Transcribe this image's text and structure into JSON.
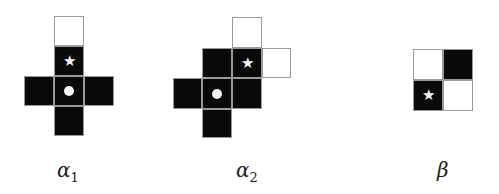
{
  "figures": [
    {
      "id": "alpha1",
      "label": "α",
      "subscript": "1",
      "label_pos": [
        57,
        160
      ],
      "cells": [
        {
          "x": 54,
          "y": 16,
          "w": 30,
          "h": 30,
          "fill": "white",
          "mark": ""
        },
        {
          "x": 54,
          "y": 46,
          "w": 30,
          "h": 30,
          "fill": "black",
          "mark": "star"
        },
        {
          "x": 24,
          "y": 76,
          "w": 30,
          "h": 30,
          "fill": "black",
          "mark": ""
        },
        {
          "x": 54,
          "y": 76,
          "w": 30,
          "h": 30,
          "fill": "black",
          "mark": "dot"
        },
        {
          "x": 84,
          "y": 76,
          "w": 30,
          "h": 30,
          "fill": "black",
          "mark": ""
        },
        {
          "x": 54,
          "y": 106,
          "w": 30,
          "h": 30,
          "fill": "black",
          "mark": ""
        }
      ]
    },
    {
      "id": "alpha2",
      "label": "α",
      "subscript": "2",
      "label_pos": [
        236,
        160
      ],
      "cells": [
        {
          "x": 232,
          "y": 17,
          "w": 30,
          "h": 31,
          "fill": "white",
          "mark": ""
        },
        {
          "x": 202,
          "y": 48,
          "w": 30,
          "h": 30,
          "fill": "black",
          "mark": ""
        },
        {
          "x": 232,
          "y": 48,
          "w": 30,
          "h": 30,
          "fill": "black",
          "mark": "star"
        },
        {
          "x": 262,
          "y": 48,
          "w": 29,
          "h": 30,
          "fill": "white",
          "mark": ""
        },
        {
          "x": 173,
          "y": 78,
          "w": 29,
          "h": 31,
          "fill": "black",
          "mark": ""
        },
        {
          "x": 202,
          "y": 78,
          "w": 30,
          "h": 31,
          "fill": "black",
          "mark": "dot"
        },
        {
          "x": 232,
          "y": 78,
          "w": 30,
          "h": 31,
          "fill": "black",
          "mark": ""
        },
        {
          "x": 202,
          "y": 109,
          "w": 30,
          "h": 29,
          "fill": "black",
          "mark": ""
        }
      ]
    },
    {
      "id": "beta",
      "label": "β",
      "subscript": "",
      "label_pos": [
        437,
        160
      ],
      "cells": [
        {
          "x": 413,
          "y": 49,
          "w": 30,
          "h": 31,
          "fill": "white",
          "mark": ""
        },
        {
          "x": 443,
          "y": 49,
          "w": 30,
          "h": 31,
          "fill": "black",
          "mark": ""
        },
        {
          "x": 413,
          "y": 80,
          "w": 30,
          "h": 31,
          "fill": "black",
          "mark": "star"
        },
        {
          "x": 443,
          "y": 80,
          "w": 30,
          "h": 31,
          "fill": "white",
          "mark": ""
        }
      ]
    }
  ],
  "marks": {
    "star": "★",
    "dot": ""
  },
  "labels": {
    "alpha1": {
      "base": "α",
      "sub": "1"
    },
    "alpha2": {
      "base": "α",
      "sub": "2"
    },
    "beta": {
      "base": "β",
      "sub": ""
    }
  }
}
